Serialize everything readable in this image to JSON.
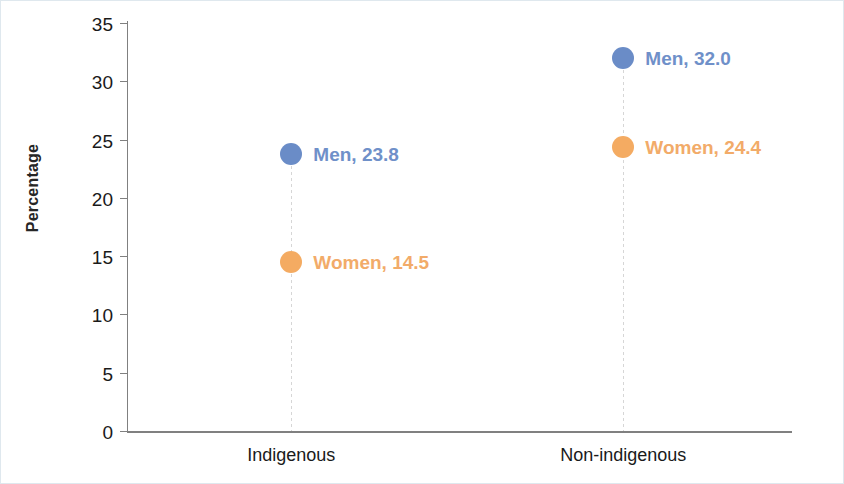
{
  "chart_data": {
    "type": "scatter",
    "title": "",
    "subtitle": "",
    "xlabel": "",
    "ylabel": "Percentage",
    "categories": [
      "Indigenous",
      "Non-indigenous"
    ],
    "ylim": [
      0,
      35
    ],
    "yticks": [
      0,
      5,
      10,
      15,
      20,
      25,
      30,
      35
    ],
    "ytick_labels": [
      "0",
      "5",
      "10",
      "15",
      "20",
      "25",
      "30",
      "35"
    ],
    "grid": false,
    "legend": "none",
    "droplines": true,
    "series": [
      {
        "name": "Men",
        "color": "#6a8cc7",
        "label_color": "#6f90c9",
        "values": [
          23.8,
          32.0
        ],
        "point_labels": [
          "Men, 23.8",
          "Men, 32.0"
        ]
      },
      {
        "name": "Women",
        "color": "#f4ab62",
        "label_color": "#f2ab69",
        "values": [
          14.5,
          24.4
        ],
        "point_labels": [
          "Women, 14.5",
          "Women, 24.4"
        ]
      }
    ],
    "points": [
      {
        "category": "Indigenous",
        "series": "Men",
        "value": 23.8,
        "label": "Men, 23.8"
      },
      {
        "category": "Indigenous",
        "series": "Women",
        "value": 14.5,
        "label": "Women, 14.5"
      },
      {
        "category": "Non-indigenous",
        "series": "Men",
        "value": 32.0,
        "label": "Men, 32.0"
      },
      {
        "category": "Non-indigenous",
        "series": "Women",
        "value": 24.4,
        "label": "Women, 24.4"
      }
    ],
    "colors": {
      "men": "#6a8cc7",
      "women": "#f4ab62",
      "axis": "#808080",
      "dropline": "#d6d6d6",
      "border": "#dfe8ee",
      "text": "#1a1a1a"
    }
  }
}
